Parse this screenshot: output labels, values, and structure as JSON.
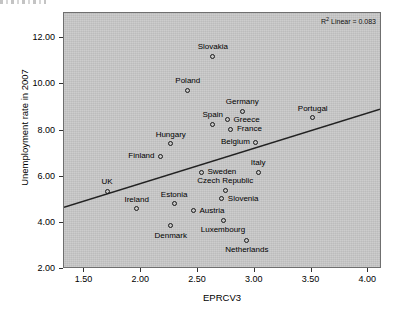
{
  "chart_data": {
    "type": "scatter",
    "title": "",
    "xlabel": "EPRCV3",
    "ylabel": "Unemployment rate in 2007",
    "xlim": [
      1.32,
      4.12
    ],
    "ylim": [
      2.0,
      13.1
    ],
    "xticks": [
      "1.50",
      "2.00",
      "2.50",
      "3.00",
      "3.50",
      "4.00"
    ],
    "xtick_values": [
      1.5,
      2.0,
      2.5,
      3.0,
      3.5,
      4.0
    ],
    "yticks": [
      "2.00",
      "4.00",
      "6.00",
      "8.00",
      "10.00",
      "12.00"
    ],
    "ytick_values": [
      2.0,
      4.0,
      6.0,
      8.0,
      10.0,
      12.0
    ],
    "grid": false,
    "legend": "none",
    "annotation": "R² Linear = 0.083",
    "annotation_prefix": "R",
    "annotation_sup": "2",
    "annotation_rest": " Linear = 0.083",
    "r_squared": 0.083,
    "fit": {
      "type": "linear",
      "x_start": 1.32,
      "y_start": 4.62,
      "x_end": 4.12,
      "y_end": 8.9
    },
    "points": [
      {
        "label": "Slovakia",
        "x": 2.63,
        "y": 11.22,
        "label_pos": "above"
      },
      {
        "label": "Poland",
        "x": 2.41,
        "y": 9.75,
        "label_pos": "above"
      },
      {
        "label": "Germany",
        "x": 2.89,
        "y": 8.83,
        "label_pos": "above"
      },
      {
        "label": "Portugal",
        "x": 3.51,
        "y": 8.55,
        "label_pos": "above"
      },
      {
        "label": "Greece",
        "x": 2.76,
        "y": 8.47,
        "label_pos": "right"
      },
      {
        "label": "Spain",
        "x": 2.63,
        "y": 8.28,
        "label_pos": "above"
      },
      {
        "label": "France",
        "x": 2.79,
        "y": 8.05,
        "label_pos": "right"
      },
      {
        "label": "Belgium",
        "x": 3.01,
        "y": 7.5,
        "label_pos": "left"
      },
      {
        "label": "Hungary",
        "x": 2.26,
        "y": 7.43,
        "label_pos": "above"
      },
      {
        "label": "Finland",
        "x": 2.17,
        "y": 6.88,
        "label_pos": "left"
      },
      {
        "label": "Italy",
        "x": 3.03,
        "y": 6.2,
        "label_pos": "above"
      },
      {
        "label": "Sweden",
        "x": 2.53,
        "y": 6.2,
        "label_pos": "right"
      },
      {
        "label": "Czech Republic",
        "x": 2.74,
        "y": 5.42,
        "label_pos": "above"
      },
      {
        "label": "UK",
        "x": 1.7,
        "y": 5.37,
        "label_pos": "above"
      },
      {
        "label": "Slovenia",
        "x": 2.71,
        "y": 5.05,
        "label_pos": "right"
      },
      {
        "label": "Estonia",
        "x": 2.29,
        "y": 4.83,
        "label_pos": "above"
      },
      {
        "label": "Ireland",
        "x": 1.96,
        "y": 4.61,
        "label_pos": "above"
      },
      {
        "label": "Austria",
        "x": 2.46,
        "y": 4.52,
        "label_pos": "right"
      },
      {
        "label": "Luxembourg",
        "x": 2.72,
        "y": 4.11,
        "label_pos": "below"
      },
      {
        "label": "Denmark",
        "x": 2.26,
        "y": 3.87,
        "label_pos": "below"
      },
      {
        "label": "Netherlands",
        "x": 2.93,
        "y": 3.25,
        "label_pos": "below"
      }
    ]
  },
  "colors": {
    "plot_background": "#c9c9c9",
    "frame": "#6f6f6f",
    "marker": "#1a1a1a",
    "line": "#222222",
    "text": "#000000"
  }
}
